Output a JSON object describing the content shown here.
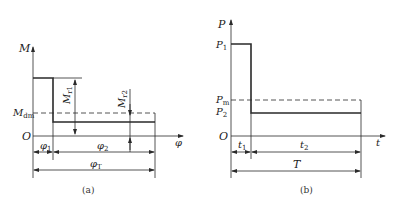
{
  "figure_a": {
    "caption": "(a)",
    "y_axis_label": "M",
    "x_axis_label": "φ",
    "origin_label": "O",
    "mean_level_label": {
      "main": "M",
      "sub": "dm"
    },
    "arrow_labels": {
      "mr1": {
        "main": "M",
        "sub": "r1"
      },
      "mr2": {
        "main": "M",
        "sub": "r2"
      }
    },
    "dimensions": {
      "phi1": {
        "main": "φ",
        "sub": "1"
      },
      "phi2": {
        "main": "φ",
        "sub": "2"
      },
      "phiT": {
        "main": "φ",
        "sub": "T"
      }
    }
  },
  "figure_b": {
    "caption": "(b)",
    "y_axis_label": "P",
    "x_axis_label": "t",
    "origin_label": "O",
    "levels": {
      "p1": {
        "main": "P",
        "sub": "1"
      },
      "pm": {
        "main": "P",
        "sub": "m"
      },
      "p2": {
        "main": "P",
        "sub": "2"
      }
    },
    "dimensions": {
      "t1": {
        "main": "t",
        "sub": "1"
      },
      "t2": {
        "main": "t",
        "sub": "2"
      },
      "T": {
        "main": "T"
      }
    }
  },
  "colors": {
    "line": "#2a2a2a",
    "background": "#ffffff"
  }
}
